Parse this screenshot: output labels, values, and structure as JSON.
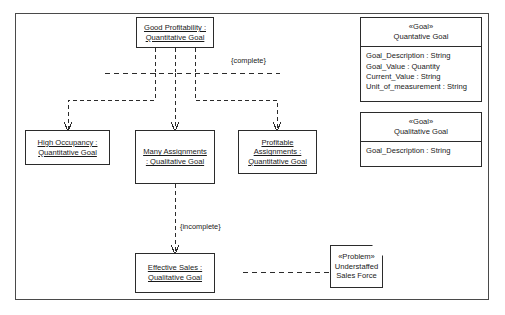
{
  "diagram": {
    "instances": [
      {
        "id": "good-profitability",
        "lines": [
          "Good Profitability :",
          "Quantitative Goal"
        ]
      },
      {
        "id": "high-occupancy",
        "lines": [
          "High Occupancy :",
          "Quantitative Goal"
        ]
      },
      {
        "id": "many-assignments",
        "lines": [
          "Many Assignments",
          ": Qualitative Goal"
        ]
      },
      {
        "id": "profitable-assignments",
        "lines": [
          "Profitable",
          "Assignments :",
          "Quantitative Goal"
        ]
      },
      {
        "id": "effective-sales",
        "lines": [
          "Effective Sales :",
          "Qualitative Goal"
        ]
      }
    ],
    "classes": [
      {
        "id": "quantative-goal",
        "stereotype": "«Goal»",
        "name": "Quantative Goal",
        "attributes": [
          "Goal_Description : String",
          "Goal_Value : Quantity",
          "Current_Value : String",
          "Unit_of_measurement : String"
        ]
      },
      {
        "id": "qualitative-goal",
        "stereotype": "«Goal»",
        "name": "Qualitative Goal",
        "attributes": [
          "Goal_Description : String"
        ]
      }
    ],
    "note": {
      "id": "understaffed-sales-force",
      "stereotype": "«Problem»",
      "lines": [
        "Understaffed",
        "Sales Force"
      ]
    },
    "edge_labels": {
      "complete": "{complete}",
      "incomplete": "{incomplete}"
    },
    "colors": {
      "stroke": "#2b2b2b",
      "frame": "#4a4a4a",
      "background": "#ffffff",
      "text": "#1a1a1a"
    }
  }
}
